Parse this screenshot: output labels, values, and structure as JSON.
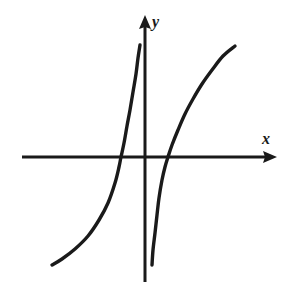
{
  "figure": {
    "kind": "hand-drawn-math-graph",
    "background_color": "#ffffff",
    "ink_color": "#1a1a1a",
    "x_axis_label": "x",
    "y_axis_label": "y"
  },
  "chart_data": {
    "type": "line",
    "title": "",
    "subtitle": "",
    "xlabel": "x",
    "ylabel": "y",
    "grid": false,
    "legend": "none",
    "axes": {
      "origin_px": [
        145,
        157
      ],
      "x_axis_px": {
        "start": [
          22,
          157
        ],
        "end": [
          277,
          157
        ],
        "arrow": "right"
      },
      "y_axis_px": {
        "start": [
          145,
          282
        ],
        "end": [
          145,
          15
        ],
        "arrow": "up"
      },
      "xlim": [
        -4.1,
        4.4
      ],
      "ylim": [
        -4.2,
        4.6
      ],
      "x_ticks": [],
      "y_ticks": []
    },
    "annotations": [
      {
        "text": "x",
        "px": [
          268,
          141
        ],
        "style": "italic-serif"
      },
      {
        "text": "y",
        "px": [
          157,
          22
        ],
        "style": "italic-serif"
      }
    ],
    "series": [
      {
        "name": "left-branch",
        "description": "increasing branch rising steeply to a near-vertical asymptote just left of the y-axis",
        "stroke_color": "#1a1a1a",
        "stroke_width_px": 3.4,
        "x_axis_crossing_px": [
          121,
          157
        ],
        "points_px": [
          [
            52,
            265
          ],
          [
            62,
            259
          ],
          [
            75,
            249
          ],
          [
            88,
            236
          ],
          [
            99,
            220
          ],
          [
            108,
            203
          ],
          [
            115,
            183
          ],
          [
            119,
            167
          ],
          [
            121,
            157
          ],
          [
            124,
            143
          ],
          [
            127,
            126
          ],
          [
            130,
            110
          ],
          [
            133,
            92
          ],
          [
            136,
            74
          ],
          [
            138,
            58
          ],
          [
            140,
            45
          ]
        ]
      },
      {
        "name": "right-branch",
        "description": "increasing branch rising from just right of the y-axis and flattening toward the upper right",
        "stroke_color": "#1a1a1a",
        "stroke_width_px": 3.4,
        "x_axis_crossing_px": [
          168,
          157
        ],
        "points_px": [
          [
            152,
            265
          ],
          [
            153,
            250
          ],
          [
            155,
            233
          ],
          [
            157,
            215
          ],
          [
            159,
            198
          ],
          [
            162,
            180
          ],
          [
            165,
            167
          ],
          [
            168,
            157
          ],
          [
            172,
            145
          ],
          [
            178,
            130
          ],
          [
            185,
            114
          ],
          [
            193,
            99
          ],
          [
            202,
            84
          ],
          [
            212,
            70
          ],
          [
            223,
            56
          ],
          [
            235,
            46
          ]
        ]
      }
    ]
  }
}
